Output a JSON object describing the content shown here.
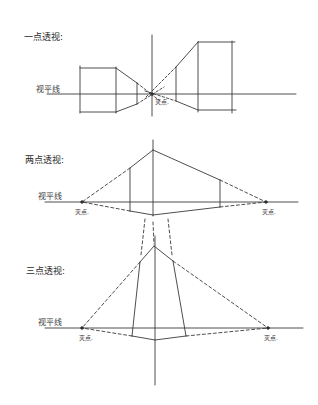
{
  "diagram": {
    "sections": [
      {
        "id": "one-point",
        "title": "一点透视:",
        "horizon_label": "视平线",
        "vanishing_points": [
          {
            "label": "灭点."
          }
        ]
      },
      {
        "id": "two-point",
        "title": "两点透视:",
        "horizon_label": "视平线",
        "vanishing_points": [
          {
            "label": "灭点."
          },
          {
            "label": "灭点."
          }
        ]
      },
      {
        "id": "three-point",
        "title": "三点透视:",
        "horizon_label": "视平线",
        "vanishing_points": [
          {
            "label": "灭点."
          },
          {
            "label": "灭点."
          }
        ]
      }
    ],
    "colors": {
      "ink": "#3a3a3a",
      "background": "#ffffff"
    }
  }
}
